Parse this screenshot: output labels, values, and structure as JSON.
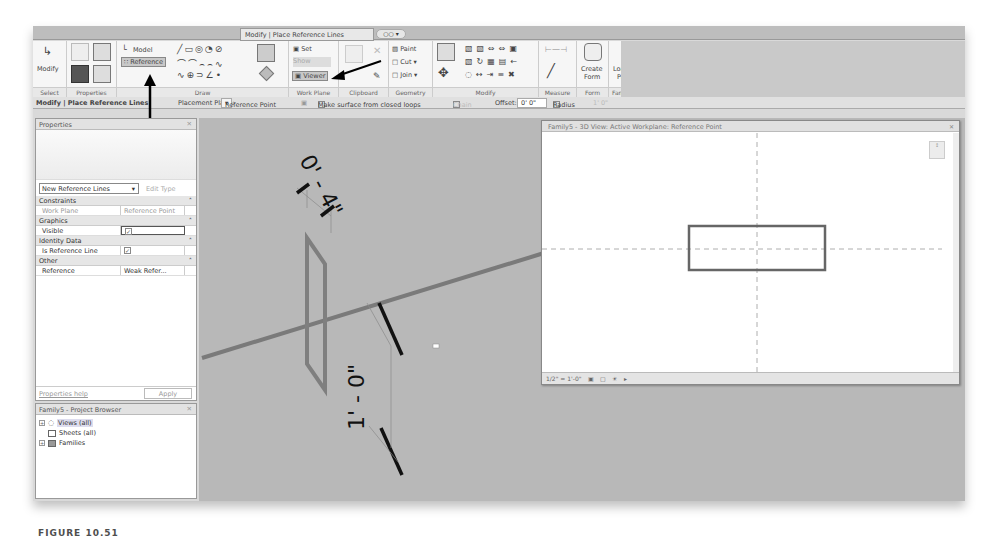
{
  "ribbon": {
    "context_tab": "Modify | Place Reference Lines",
    "tab_option": "○○ ▾",
    "panels": {
      "select": {
        "label": "Select",
        "modify": "Modify"
      },
      "properties": {
        "label": "Properties"
      },
      "draw": {
        "label": "Draw",
        "model": "Model",
        "reference": "Reference"
      },
      "work_plane": {
        "label": "Work Plane",
        "set": "Set",
        "show": "Show",
        "viewer": "Viewer"
      },
      "clipboard": {
        "label": "Clipboard"
      },
      "geometry": {
        "label": "Geometry",
        "paint": "Paint",
        "cut": "Cut",
        "join": "Join"
      },
      "modify": {
        "label": "Modify"
      },
      "measure": {
        "label": "Measure"
      },
      "form": {
        "label": "Form",
        "create_form_1": "Create",
        "create_form_2": "Form"
      },
      "family_editor": {
        "label": "Family Editor",
        "load_1": "Load into",
        "load_2": "Project"
      }
    }
  },
  "options_bar": {
    "context": "Modify | Place Reference Lines",
    "placement_plane_label": "Placement Plane:",
    "placement_plane_value": "Reference Point",
    "make_surface": "Make surface from closed loops",
    "chain": "Chain",
    "offset_label": "Offset:",
    "offset_value": "0' 0\"",
    "radius_label": "Radius",
    "radius_value": "1' 0\""
  },
  "properties": {
    "title": "Properties",
    "type_selector": "New Reference Lines",
    "edit_type": "Edit Type",
    "categories": [
      {
        "name": "Constraints",
        "rows": [
          {
            "key": "Work Plane",
            "value": "Reference Point",
            "dim": true
          }
        ]
      },
      {
        "name": "Graphics",
        "rows": [
          {
            "key": "Visible",
            "value": "✓",
            "checkbox": true
          }
        ]
      },
      {
        "name": "Identity Data",
        "rows": [
          {
            "key": "Is Reference Line",
            "value": "✓",
            "checkbox": true
          }
        ]
      },
      {
        "name": "Other",
        "rows": [
          {
            "key": "Reference",
            "value": "Weak Refer..."
          }
        ]
      }
    ],
    "help_link": "Properties help",
    "apply": "Apply"
  },
  "project_browser": {
    "title": "Family5 - Project Browser",
    "items": [
      {
        "label": "Views (all)",
        "expander": "+"
      },
      {
        "label": "Sheets (all)",
        "expander": ""
      },
      {
        "label": "Families",
        "expander": "+"
      }
    ]
  },
  "canvas": {
    "dim_top": "0' - 4\"",
    "dim_bottom": "1' - 0\""
  },
  "view_window": {
    "title": "Family5 - 3D View: Active Workplane: Reference Point",
    "scale": "1/2\" = 1'-0\"",
    "viewcube": "↕"
  },
  "caption": "FIGURE 10.51"
}
